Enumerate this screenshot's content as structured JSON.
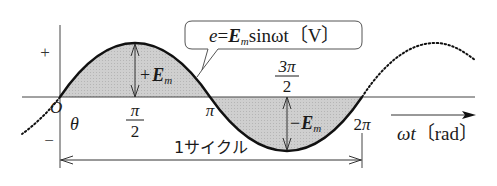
{
  "diagram": {
    "equation": {
      "e": "e",
      "eq": "=",
      "E": "E",
      "sub_m": "m",
      "rest": "sinωt",
      "unit": "〔V〕"
    },
    "y_axis": {
      "plus": "+",
      "minus": "−"
    },
    "x_axis": {
      "origin": "O",
      "theta": "θ",
      "ticks": [
        {
          "num": "π",
          "den": "2"
        },
        {
          "label": "π"
        },
        {
          "num": "3π",
          "den": "2"
        },
        {
          "label": "2π"
        }
      ],
      "label_omega_t": "ωt",
      "label_unit": "〔rad〕"
    },
    "amplitude": {
      "positive_sign": "+",
      "negative_sign": "−",
      "E": "E",
      "sub_m": "m"
    },
    "cycle_label": "1サイクル",
    "colors": {
      "curve": "#1a1a1a",
      "fill": "#c8c8c8",
      "axis": "#333333",
      "text": "#1a1a1a"
    }
  }
}
